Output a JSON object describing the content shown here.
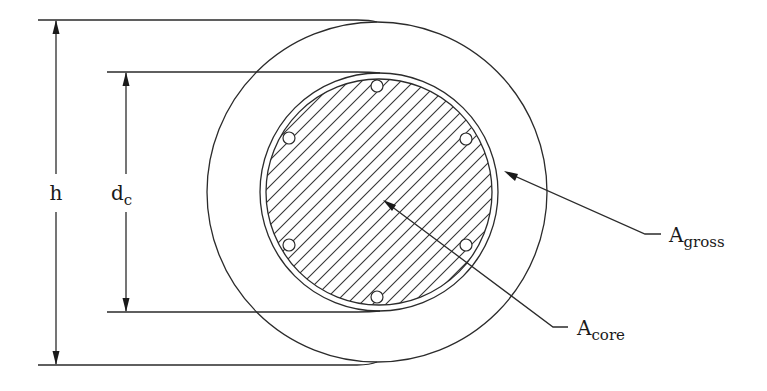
{
  "figure": {
    "type": "circular column cross-section",
    "colors": {
      "line": "#2b2b2b",
      "background": "#ffffff"
    }
  },
  "labels": {
    "h": {
      "main": "h",
      "sub": ""
    },
    "dc": {
      "main": "d",
      "sub": "c"
    },
    "gross": {
      "main": "A",
      "sub": "gross"
    },
    "core": {
      "main": "A",
      "sub": "core"
    }
  },
  "geometry": {
    "outer_circle": {
      "cx": 377,
      "cy": 192,
      "r": 170
    },
    "core_ring": {
      "cx": 379,
      "cy": 192,
      "r": 119
    },
    "core_hatched": {
      "cx": 379,
      "cy": 192,
      "r": 113
    },
    "rebar_count": 6,
    "rebar_radius": 6
  }
}
